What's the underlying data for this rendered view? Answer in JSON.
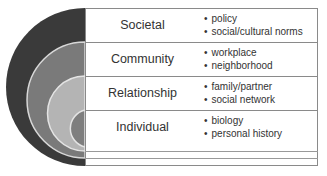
{
  "diagram": {
    "colors": {
      "societal": "#3a3a3a",
      "community": "#7a7a7a",
      "relationship": "#b4b4b4",
      "individual": "#7e7e7e",
      "divider": "#d8d8d8"
    },
    "levels": [
      {
        "label": "Societal",
        "items": [
          "policy",
          "social/cultural norms"
        ]
      },
      {
        "label": "Community",
        "items": [
          "workplace",
          "neighborhood"
        ]
      },
      {
        "label": "Relationship",
        "items": [
          "family/partner",
          "social network"
        ]
      },
      {
        "label": "Individual",
        "items": [
          "biology",
          "personal history"
        ]
      }
    ]
  }
}
